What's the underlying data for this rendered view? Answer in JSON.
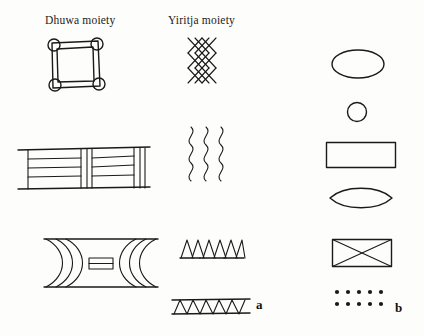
{
  "figure": {
    "background_color": "#fdfdfb",
    "ink_color": "#1a1a1a",
    "columns": {
      "left_header": "Dhuwa moiety",
      "right_header": "Yiritja moiety"
    },
    "panel_labels": {
      "a": "a",
      "b": "b"
    },
    "panels": [
      {
        "id": "a",
        "description": "Two columns of clan design motifs",
        "groups": [
          {
            "column": "Dhuwa moiety",
            "motifs": [
              {
                "name": "square-with-corner-circles",
                "shape": "square-frame",
                "corner_circles": 4,
                "row": 1
              },
              {
                "name": "horizontal-banded-panel",
                "shape": "banded-rectangle",
                "horizontal_bands": 4,
                "vertical_dividers": 3,
                "row": 2
              },
              {
                "name": "hourglass-bowtie",
                "shape": "bowtie",
                "curved-bands-per-side": 3,
                "center_rectangle_lines": 2,
                "row": 3
              }
            ]
          },
          {
            "column": "Yiritja moiety",
            "motifs": [
              {
                "name": "diamond-lattice",
                "shape": "crosshatch-lattice",
                "columns": 3,
                "rows": 5,
                "row": 1
              },
              {
                "name": "wavy-lines",
                "shape": "vertical-waves",
                "line_count": 3,
                "row": 2
              },
              {
                "name": "triangle-row",
                "shape": "triangles-on-baseline",
                "triangle_count": 6,
                "row": 3
              },
              {
                "name": "zigzag-band",
                "shape": "zigzag-between-rules",
                "zigzag_peaks": 6,
                "row": 4
              }
            ]
          }
        ]
      },
      {
        "id": "b",
        "description": "Single column of geometric motifs",
        "motifs": [
          {
            "name": "ellipse-large",
            "shape": "ellipse",
            "row": 1
          },
          {
            "name": "circle-small",
            "shape": "circle",
            "row": 2
          },
          {
            "name": "rectangle-plain",
            "shape": "rectangle",
            "row": 3
          },
          {
            "name": "lens-leaf",
            "shape": "lens",
            "row": 4
          },
          {
            "name": "rectangle-with-cross",
            "shape": "rectangle-x",
            "row": 5
          },
          {
            "name": "dot-grid",
            "shape": "dots",
            "rows": 2,
            "dots_per_row": 5,
            "row": 6
          }
        ]
      }
    ]
  }
}
